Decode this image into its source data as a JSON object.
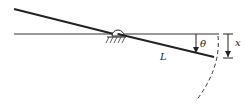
{
  "diagram": {
    "type": "pendulum-lever",
    "labels": {
      "length": "L",
      "angle": "θ",
      "displacement": "x"
    },
    "colors": {
      "stroke": "#222222",
      "background": "#ffffff"
    }
  }
}
